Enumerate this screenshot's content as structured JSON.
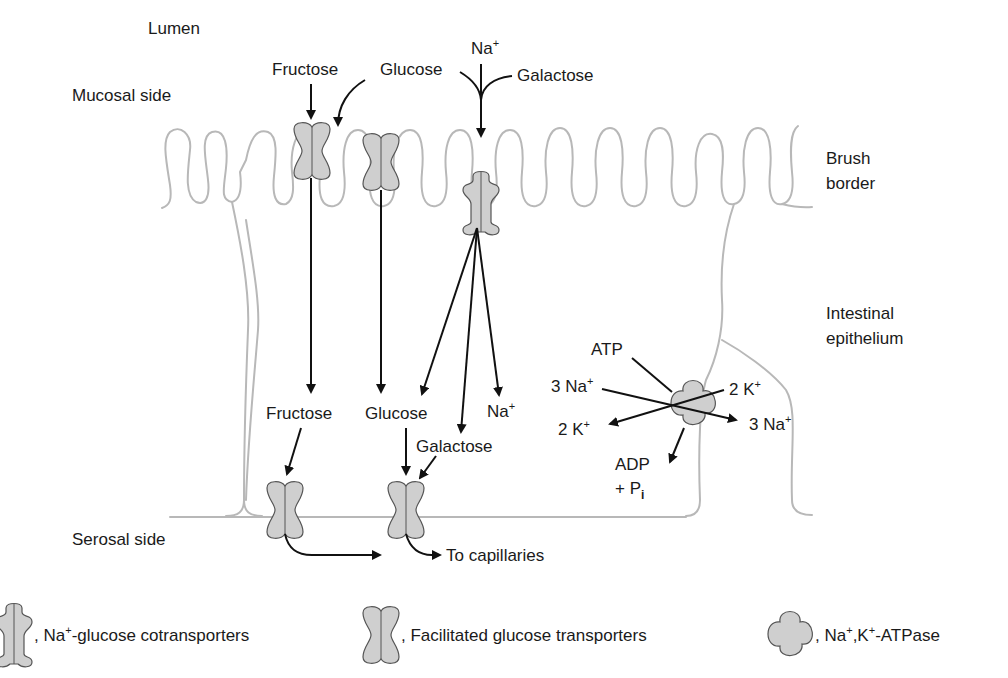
{
  "regions": {
    "lumen": "Lumen",
    "mucosal_side": "Mucosal side",
    "serosal_side": "Serosal side",
    "brush_border_1": "Brush",
    "brush_border_2": "border",
    "epithelium_1": "Intestinal",
    "epithelium_2": "epithelium"
  },
  "apical_labels": {
    "fructose": "Fructose",
    "glucose": "Glucose",
    "na": "Na",
    "na_sup": "+",
    "galactose": "Galactose"
  },
  "intracellular_labels": {
    "fructose": "Fructose",
    "glucose": "Glucose",
    "na": "Na",
    "na_sup": "+",
    "galactose": "Galactose"
  },
  "pump_labels": {
    "atp": "ATP",
    "na_in": "3 Na",
    "k_out": "2 K",
    "k_in": "2 K",
    "na_out": "3 Na",
    "sup": "+",
    "adp": "ADP",
    "pi": "+ P",
    "pi_sub": "i"
  },
  "basolateral": {
    "to_capillaries": "To capillaries"
  },
  "legend": [
    {
      "icon": "na-glucose-cotransporter-icon",
      "prefix": ", Na",
      "sup": "+",
      "text": "-glucose cotransporters"
    },
    {
      "icon": "facilitated-transporter-icon",
      "prefix": ", Facilitated glucose transporters"
    },
    {
      "icon": "na-k-atpase-icon",
      "prefix": ", Na",
      "sup": "+",
      "mid": ",K",
      "sup2": "+",
      "text": "-ATPase"
    }
  ],
  "colors": {
    "membrane": "#b8b8b8",
    "protein_fill": "#cfcfcf",
    "arrow": "#111111"
  }
}
